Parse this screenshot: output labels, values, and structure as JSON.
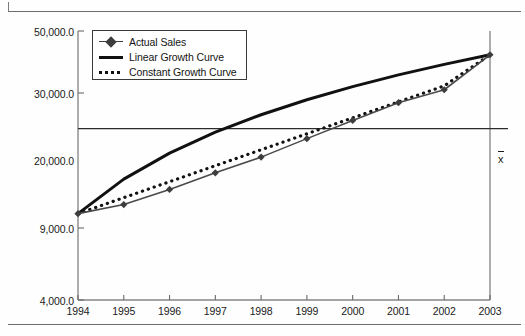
{
  "figure": {
    "kind": "line-chart",
    "mean_marker_label": "x"
  },
  "chart_data": {
    "type": "line",
    "title": "",
    "xlabel": "",
    "ylabel": "",
    "yscale": "log",
    "ylim": [
      4000,
      50000
    ],
    "grid": false,
    "legend_position": "top-left",
    "x": [
      1994,
      1995,
      1996,
      1997,
      1998,
      1999,
      2000,
      2001,
      2002,
      2003
    ],
    "categories": [
      "1994",
      "1995",
      "1996",
      "1997",
      "1998",
      "1999",
      "2000",
      "2001",
      "2002",
      "2003"
    ],
    "ytick_labels": [
      "50,000.0",
      "30,000.0",
      "20,000.0",
      "9,000.0",
      "4,000.0"
    ],
    "ytick_values": [
      50000,
      30000,
      20000,
      9000,
      4000
    ],
    "reference_lines": [
      {
        "name": "mean",
        "label": "x",
        "value": 20000,
        "orientation": "horizontal"
      }
    ],
    "series": [
      {
        "name": "Actual Sales",
        "style": "line-marker",
        "marker": "diamond",
        "color": "#3d3d3d",
        "values": [
          9000,
          9800,
          11300,
          13200,
          15300,
          18200,
          21600,
          25500,
          28800,
          40000
        ]
      },
      {
        "name": "Linear Growth Curve",
        "style": "solid-thick",
        "color": "#111111",
        "values": [
          9000,
          12444,
          15889,
          19333,
          22778,
          26222,
          29667,
          33111,
          36556,
          40000
        ]
      },
      {
        "name": "Constant Growth Curve",
        "style": "dotted",
        "color": "#111111",
        "values": [
          9000,
          10455,
          12146,
          14110,
          16392,
          19043,
          22122,
          25699,
          29854,
          40000
        ]
      }
    ]
  },
  "legend": {
    "items": [
      {
        "label": "Actual Sales",
        "key": "diamond-line-key"
      },
      {
        "label": "Linear Growth Curve",
        "key": "thick-line-key"
      },
      {
        "label": "Constant Growth Curve",
        "key": "dotted-line-key"
      }
    ]
  }
}
